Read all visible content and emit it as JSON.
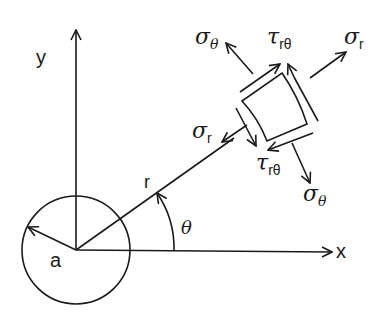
{
  "diagram": {
    "type": "polar-coordinate stress element",
    "axes": {
      "x_label": "x",
      "y_label": "y"
    },
    "hole": {
      "radius_label": "a"
    },
    "radial_line": {
      "label": "r"
    },
    "angle": {
      "label": "θ"
    },
    "stresses": {
      "sigma_r_outer": {
        "symbol": "σ",
        "subscript": "r"
      },
      "sigma_r_inner": {
        "symbol": "σ",
        "subscript": "r"
      },
      "sigma_theta_top": {
        "symbol": "σ",
        "subscript": "θ"
      },
      "sigma_theta_bottom": {
        "symbol": "σ",
        "subscript": "θ"
      },
      "tau_top": {
        "symbol": "τ",
        "subscript": "rθ"
      },
      "tau_bottom": {
        "symbol": "τ",
        "subscript": "rθ"
      }
    },
    "colors": {
      "ink": "#1a1a1a",
      "background": "#ffffff"
    }
  }
}
